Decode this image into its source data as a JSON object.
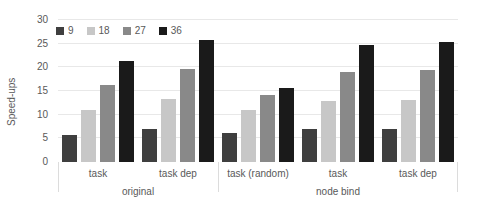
{
  "chart_data": {
    "type": "bar",
    "title": "",
    "xlabel": "",
    "ylabel": "Speed-ups",
    "ylim": [
      0,
      30
    ],
    "yticks": [
      0,
      5,
      10,
      15,
      20,
      25,
      30
    ],
    "grid": "horizontal",
    "legend_position": "top-left",
    "series_names": [
      "9",
      "18",
      "27",
      "36"
    ],
    "series_colors": [
      "#3f3f3f",
      "#c7c7c7",
      "#898989",
      "#1a1a1a"
    ],
    "sections": [
      {
        "label": "original",
        "groups": [
          {
            "label": "task",
            "values": [
              5.7,
              11.0,
              16.3,
              21.3
            ]
          },
          {
            "label": "task dep",
            "values": [
              7.0,
              13.3,
              19.7,
              25.8
            ]
          }
        ]
      },
      {
        "label": "node bind",
        "groups": [
          {
            "label": "task (random)",
            "values": [
              6.2,
              11.0,
              14.2,
              15.6
            ]
          },
          {
            "label": "task",
            "values": [
              6.9,
              12.9,
              19.1,
              24.8
            ]
          },
          {
            "label": "task dep",
            "values": [
              6.9,
              13.1,
              19.4,
              25.4
            ]
          }
        ]
      }
    ],
    "colors": {
      "gridline": "#e8e8e8",
      "separator": "#dcdcdc",
      "text": "#595959",
      "background": "#ffffff"
    }
  }
}
